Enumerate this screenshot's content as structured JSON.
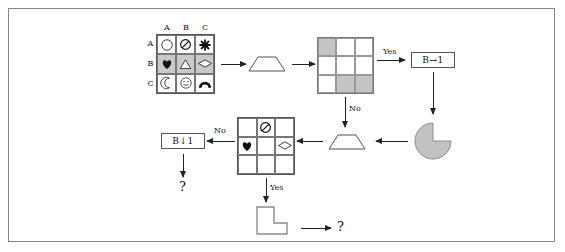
{
  "diagram": {
    "colors": {
      "shaded": "#c9c9c9",
      "gray_cell": "#c4c4c4",
      "stroke": "#222222",
      "frame": "#888888"
    },
    "grid1": {
      "name": "symbol-grid",
      "col_headers": [
        "A",
        "B",
        "C"
      ],
      "row_headers": [
        "A",
        "B",
        "C"
      ],
      "cells": [
        [
          {
            "symbol": "circle-icon",
            "shaded": false
          },
          {
            "symbol": "no-entry-icon",
            "shaded": false
          },
          {
            "symbol": "flower-asterisk-icon",
            "shaded": false
          }
        ],
        [
          {
            "symbol": "heart-filled-icon",
            "shaded": true
          },
          {
            "symbol": "triangle-icon",
            "shaded": true
          },
          {
            "symbol": "diamond-icon",
            "shaded": true
          }
        ],
        [
          {
            "symbol": "crescent-moon-icon",
            "shaded": false
          },
          {
            "symbol": "smiley-face-icon",
            "shaded": false
          },
          {
            "symbol": "arch-icon",
            "shaded": false
          }
        ]
      ]
    },
    "grid2": {
      "name": "shaded-grid",
      "cells": [
        [
          "gray",
          "white",
          "white"
        ],
        [
          "white",
          "white",
          "white"
        ],
        [
          "white",
          "gray",
          "gray"
        ]
      ]
    },
    "grid3": {
      "name": "symbol-grid-sparse",
      "cells": [
        [
          {
            "symbol": "empty"
          },
          {
            "symbol": "no-entry-icon"
          },
          {
            "symbol": "empty"
          }
        ],
        [
          {
            "symbol": "heart-filled-icon"
          },
          {
            "symbol": "empty"
          },
          {
            "symbol": "diamond-icon"
          }
        ],
        [
          {
            "symbol": "empty"
          },
          {
            "symbol": "empty"
          },
          {
            "symbol": "empty"
          }
        ]
      ]
    },
    "shapes": {
      "trapezoid_top": "trapezoid-shape",
      "trapezoid_bottom": "trapezoid-shape",
      "pacman": "pacman-pie-shape",
      "lshape": "l-polyomino-shape"
    },
    "boxes": {
      "b_right_1": "B→1",
      "b_down_1": "B↓1"
    },
    "edge_labels": {
      "yes_top": "Yes",
      "no_right": "No",
      "no_left": "No",
      "yes_bottom": "Yes"
    },
    "outputs": {
      "q_left": "?",
      "q_bottom": "?"
    }
  }
}
